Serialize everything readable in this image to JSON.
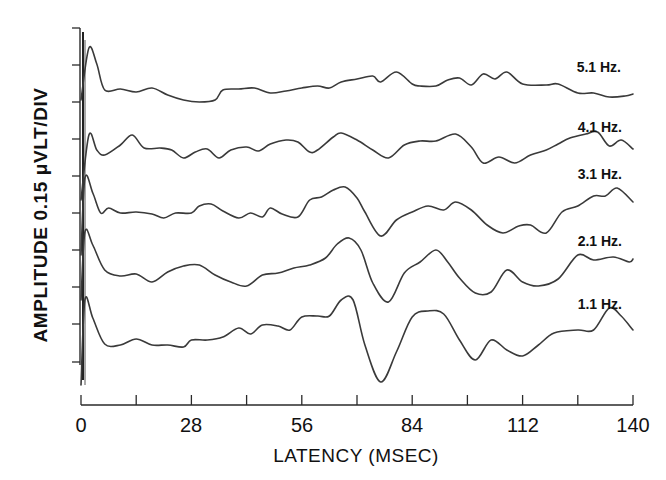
{
  "chart_data": {
    "type": "line",
    "title": "",
    "xlabel": "LATENCY (MSEC)",
    "ylabel": "AMPLITUDE 0.15 μVLT/DIV",
    "x_ticks": [
      0,
      28,
      56,
      84,
      112,
      140
    ],
    "x_minor_step": 14,
    "xlim": [
      0,
      140
    ],
    "grid": false,
    "legend_position": "inline-right",
    "y_units": "pixel y (stacked traces, 0.15 μV per division)",
    "series": [
      {
        "name": "5.1 Hz.",
        "label_pos": [
          621,
          72
        ],
        "points": [
          [
            0,
            100
          ],
          [
            2,
            48
          ],
          [
            4,
            64
          ],
          [
            6,
            90
          ],
          [
            10,
            89
          ],
          [
            14,
            92
          ],
          [
            18,
            88
          ],
          [
            22,
            95
          ],
          [
            26,
            100
          ],
          [
            30,
            102
          ],
          [
            34,
            100
          ],
          [
            36,
            90
          ],
          [
            40,
            89
          ],
          [
            44,
            88
          ],
          [
            48,
            93
          ],
          [
            52,
            91
          ],
          [
            56,
            88
          ],
          [
            60,
            86
          ],
          [
            63,
            88
          ],
          [
            66,
            82
          ],
          [
            70,
            79
          ],
          [
            74,
            76
          ],
          [
            76,
            82
          ],
          [
            80,
            72
          ],
          [
            84,
            84
          ],
          [
            86,
            86
          ],
          [
            90,
            86
          ],
          [
            93,
            80
          ],
          [
            96,
            78
          ],
          [
            99,
            85
          ],
          [
            102,
            74
          ],
          [
            105,
            79
          ],
          [
            108,
            72
          ],
          [
            112,
            84
          ],
          [
            118,
            85
          ],
          [
            121,
            84
          ],
          [
            126,
            93
          ],
          [
            130,
            93
          ],
          [
            134,
            97
          ],
          [
            138,
            96
          ],
          [
            140,
            94
          ]
        ]
      },
      {
        "name": "4.1 Hz.",
        "label_pos": [
          622,
          132
        ],
        "points": [
          [
            0,
            200
          ],
          [
            2,
            135
          ],
          [
            4,
            150
          ],
          [
            6,
            155
          ],
          [
            10,
            145
          ],
          [
            13,
            135
          ],
          [
            16,
            148
          ],
          [
            20,
            148
          ],
          [
            23,
            150
          ],
          [
            26,
            158
          ],
          [
            29,
            152
          ],
          [
            32,
            149
          ],
          [
            35,
            158
          ],
          [
            38,
            150
          ],
          [
            42,
            147
          ],
          [
            45,
            151
          ],
          [
            48,
            144
          ],
          [
            52,
            140
          ],
          [
            55,
            142
          ],
          [
            58,
            152
          ],
          [
            60,
            150
          ],
          [
            64,
            137
          ],
          [
            66,
            133
          ],
          [
            70,
            140
          ],
          [
            74,
            150
          ],
          [
            78,
            158
          ],
          [
            82,
            145
          ],
          [
            86,
            141
          ],
          [
            90,
            141
          ],
          [
            95,
            134
          ],
          [
            99,
            147
          ],
          [
            102,
            163
          ],
          [
            106,
            157
          ],
          [
            110,
            163
          ],
          [
            114,
            155
          ],
          [
            118,
            150
          ],
          [
            121,
            144
          ],
          [
            124,
            138
          ],
          [
            128,
            134
          ],
          [
            131,
            132
          ],
          [
            134,
            146
          ],
          [
            137,
            140
          ],
          [
            140,
            149
          ]
        ]
      },
      {
        "name": "3.1 Hz.",
        "label_pos": [
          622,
          179
        ],
        "points": [
          [
            0,
            255
          ],
          [
            1,
            178
          ],
          [
            3,
            193
          ],
          [
            5,
            213
          ],
          [
            7,
            208
          ],
          [
            10,
            213
          ],
          [
            14,
            212
          ],
          [
            18,
            214
          ],
          [
            21,
            218
          ],
          [
            24,
            213
          ],
          [
            28,
            213
          ],
          [
            30,
            206
          ],
          [
            33,
            204
          ],
          [
            36,
            211
          ],
          [
            40,
            218
          ],
          [
            43,
            213
          ],
          [
            46,
            217
          ],
          [
            48,
            208
          ],
          [
            51,
            214
          ],
          [
            55,
            217
          ],
          [
            58,
            200
          ],
          [
            61,
            197
          ],
          [
            64,
            190
          ],
          [
            67,
            187
          ],
          [
            70,
            198
          ],
          [
            72,
            212
          ],
          [
            76,
            236
          ],
          [
            80,
            220
          ],
          [
            84,
            212
          ],
          [
            88,
            206
          ],
          [
            92,
            210
          ],
          [
            95,
            202
          ],
          [
            99,
            210
          ],
          [
            103,
            225
          ],
          [
            107,
            233
          ],
          [
            111,
            226
          ],
          [
            114,
            225
          ],
          [
            118,
            233
          ],
          [
            122,
            212
          ],
          [
            126,
            206
          ],
          [
            130,
            196
          ],
          [
            133,
            196
          ],
          [
            136,
            188
          ],
          [
            140,
            202
          ]
        ]
      },
      {
        "name": "2.1 Hz.",
        "label_pos": [
          622,
          246
        ],
        "points": [
          [
            0,
            300
          ],
          [
            1,
            232
          ],
          [
            3,
            245
          ],
          [
            6,
            270
          ],
          [
            10,
            276
          ],
          [
            14,
            274
          ],
          [
            18,
            282
          ],
          [
            22,
            272
          ],
          [
            26,
            266
          ],
          [
            30,
            265
          ],
          [
            34,
            275
          ],
          [
            38,
            282
          ],
          [
            42,
            286
          ],
          [
            46,
            275
          ],
          [
            50,
            273
          ],
          [
            54,
            268
          ],
          [
            58,
            265
          ],
          [
            62,
            258
          ],
          [
            65,
            244
          ],
          [
            68,
            238
          ],
          [
            71,
            250
          ],
          [
            74,
            283
          ],
          [
            78,
            302
          ],
          [
            82,
            273
          ],
          [
            86,
            262
          ],
          [
            90,
            250
          ],
          [
            93,
            262
          ],
          [
            96,
            278
          ],
          [
            100,
            293
          ],
          [
            104,
            292
          ],
          [
            108,
            270
          ],
          [
            112,
            282
          ],
          [
            116,
            286
          ],
          [
            121,
            279
          ],
          [
            126,
            255
          ],
          [
            130,
            260
          ],
          [
            135,
            257
          ],
          [
            139,
            262
          ],
          [
            140,
            259
          ]
        ]
      },
      {
        "name": "1.1 Hz.",
        "label_pos": [
          622,
          309
        ],
        "points": [
          [
            0,
            385
          ],
          [
            1,
            300
          ],
          [
            3,
            318
          ],
          [
            6,
            344
          ],
          [
            10,
            345
          ],
          [
            14,
            339
          ],
          [
            18,
            345
          ],
          [
            22,
            345
          ],
          [
            26,
            347
          ],
          [
            28,
            340
          ],
          [
            32,
            340
          ],
          [
            36,
            337
          ],
          [
            40,
            328
          ],
          [
            43,
            334
          ],
          [
            46,
            325
          ],
          [
            50,
            326
          ],
          [
            53,
            330
          ],
          [
            56,
            317
          ],
          [
            60,
            316
          ],
          [
            63,
            316
          ],
          [
            66,
            300
          ],
          [
            69,
            300
          ],
          [
            72,
            345
          ],
          [
            76,
            382
          ],
          [
            80,
            352
          ],
          [
            84,
            317
          ],
          [
            88,
            311
          ],
          [
            92,
            314
          ],
          [
            96,
            340
          ],
          [
            100,
            360
          ],
          [
            104,
            340
          ],
          [
            108,
            350
          ],
          [
            112,
            356
          ],
          [
            116,
            345
          ],
          [
            120,
            333
          ],
          [
            126,
            330
          ],
          [
            130,
            330
          ],
          [
            134,
            308
          ],
          [
            137,
            316
          ],
          [
            140,
            330
          ]
        ]
      }
    ]
  },
  "axes": {
    "x_label": "LATENCY (MSEC)",
    "y_label": "AMPLITUDE 0.15 μVLT/DIV",
    "x_tick_labels": [
      "0",
      "28",
      "56",
      "84",
      "112",
      "140"
    ]
  }
}
